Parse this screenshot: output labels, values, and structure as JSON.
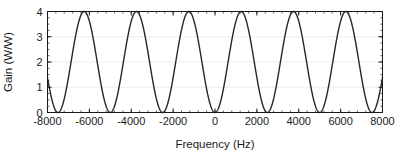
{
  "chart_data": {
    "type": "line",
    "title": "",
    "subtitle": "",
    "xlabel": "Frequency (Hz)",
    "ylabel": "Gain (W/W)",
    "xlim": [
      -8000,
      8000
    ],
    "ylim": [
      0,
      4
    ],
    "xticks": [
      -8000,
      -6000,
      -4000,
      -2000,
      0,
      2000,
      4000,
      6000,
      8000
    ],
    "xtick_labels": [
      "-8000",
      "-6000",
      "-4000",
      "-2000",
      "0",
      "2000",
      "4000",
      "6000",
      "8000"
    ],
    "yticks": [
      0,
      1,
      2,
      3,
      4
    ],
    "ytick_labels": [
      "0",
      "1",
      "2",
      "3",
      "4"
    ],
    "x_minor_tick_step": 400,
    "y_minor_tick_step": 0.25,
    "grid": true,
    "grid_axis": "y",
    "grid_color": "#e8e8e8",
    "legend": null,
    "legend_position": "none",
    "line_color": "#262626",
    "line_width": 1.4,
    "axes_color": "#1a1a1a",
    "background_color": "#ffffff",
    "formula": "4*sin(pi*f/2500)^2",
    "period_hz": 2500,
    "peak_value": 4,
    "min_value": 0,
    "peaks_hz": [
      -6250,
      -3750,
      -1250,
      1250,
      3750,
      6250
    ],
    "nulls_hz": [
      -7500,
      -5000,
      -2500,
      0,
      2500,
      5000,
      7500
    ],
    "series": [
      {
        "name": "Gain",
        "x": [
          -8000,
          -7900,
          -7800,
          -7700,
          -7600,
          -7500,
          -7400,
          -7300,
          -7200,
          -7100,
          -7000,
          -6900,
          -6800,
          -6700,
          -6600,
          -6500,
          -6400,
          -6300,
          -6200,
          -6100,
          -6000,
          -5900,
          -5800,
          -5700,
          -5600,
          -5500,
          -5400,
          -5300,
          -5200,
          -5100,
          -5000,
          -4900,
          -4800,
          -4700,
          -4600,
          -4500,
          -4400,
          -4300,
          -4200,
          -4100,
          -4000,
          -3900,
          -3800,
          -3700,
          -3600,
          -3500,
          -3400,
          -3300,
          -3200,
          -3100,
          -3000,
          -2900,
          -2800,
          -2700,
          -2600,
          -2500,
          -2400,
          -2300,
          -2200,
          -2100,
          -2000,
          -1900,
          -1800,
          -1700,
          -1600,
          -1500,
          -1400,
          -1300,
          -1200,
          -1100,
          -1000,
          -900,
          -800,
          -700,
          -600,
          -500,
          -400,
          -300,
          -200,
          -100,
          0,
          100,
          200,
          300,
          400,
          500,
          600,
          700,
          800,
          900,
          1000,
          1100,
          1200,
          1300,
          1400,
          1500,
          1600,
          1700,
          1800,
          1900,
          2000,
          2100,
          2200,
          2300,
          2400,
          2500,
          2600,
          2700,
          2800,
          2900,
          3000,
          3100,
          3200,
          3300,
          3400,
          3500,
          3600,
          3700,
          3800,
          3900,
          4000,
          4100,
          4200,
          4300,
          4400,
          4500,
          4600,
          4700,
          4800,
          4900,
          5000,
          5100,
          5200,
          5300,
          5400,
          5500,
          5600,
          5700,
          5800,
          5900,
          6000,
          6100,
          6200,
          6300,
          6400,
          6500,
          6600,
          6700,
          6800,
          6900,
          7000,
          7100,
          7200,
          7300,
          7400,
          7500,
          7600,
          7700,
          7800,
          7900,
          8000
        ],
        "y": [
          1.382,
          0.955,
          0.588,
          0.297,
          0.096,
          0.0,
          0.016,
          0.139,
          0.359,
          0.655,
          1.0,
          1.363,
          1.716,
          2.024,
          2.271,
          2.438,
          2.514,
          2.494,
          2.382,
          2.187,
          1.927,
          1.625,
          1.309,
          1.0,
          0.724,
          0.5,
          0.34,
          0.247,
          0.215,
          0.229,
          0.272,
          0.327,
          0.382,
          0.441,
          0.518,
          0.634,
          0.806,
          1.044,
          1.345,
          1.698,
          2.073,
          2.438,
          2.759,
          3.0,
          3.136,
          3.155,
          3.063,
          2.877,
          2.624,
          2.33,
          2.0,
          1.651,
          1.309,
          1.0,
          0.748,
          0.572,
          0.476,
          0.449,
          0.47,
          0.52,
          0.587,
          0.672,
          0.792,
          0.968,
          1.215,
          1.536,
          1.92,
          2.341,
          2.764,
          3.15,
          3.464,
          3.681,
          3.786,
          3.777,
          3.664,
          3.464,
          3.2,
          2.897,
          2.578,
          2.263,
          1.963,
          1.687,
          1.436,
          1.21,
          1.01,
          0.835,
          0.685,
          0.562,
          0.466,
          0.398,
          0.359,
          0.35,
          0.372,
          0.427,
          0.516,
          0.639,
          0.797,
          0.988,
          1.21,
          1.46,
          1.733,
          2.021,
          2.318,
          2.613,
          2.897,
          3.159,
          3.389,
          3.578,
          3.718,
          3.803,
          3.829,
          3.794,
          3.7,
          3.55,
          3.352,
          3.115,
          2.851,
          2.571,
          2.29,
          2.02,
          1.772,
          1.554,
          1.374,
          1.235,
          1.139,
          1.086,
          1.074,
          1.1,
          1.159,
          1.248,
          1.363,
          1.5,
          1.655,
          1.825,
          2.007,
          2.199,
          2.398,
          2.601,
          2.804,
          3.0,
          3.182,
          3.339,
          3.464,
          3.55,
          3.592,
          3.59,
          3.543,
          3.455,
          3.329,
          3.173,
          2.993,
          2.798,
          2.596,
          2.394,
          2.2,
          2.018,
          1.853,
          1.706,
          1.578,
          1.47,
          1.382
        ]
      }
    ]
  },
  "axis_titles": {
    "x": "Frequency (Hz)",
    "y": "Gain (W/W)"
  }
}
